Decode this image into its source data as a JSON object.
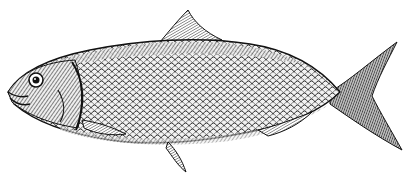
{
  "image": {
    "subject": "fish engraving",
    "style": "black and white line engraving",
    "background_color": "#ffffff",
    "ink_color": "#1a1a1a",
    "orientation": "facing left"
  }
}
